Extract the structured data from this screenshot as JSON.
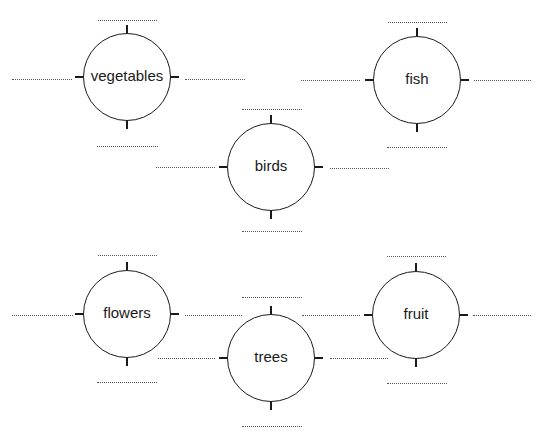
{
  "diagram": {
    "type": "word-web-worksheet",
    "stroke_color": "#1a1a1a",
    "blank_color": "#555555",
    "nodes": [
      {
        "id": "vegetables",
        "label": "vegetables",
        "cx": 127,
        "cy": 77,
        "r": 44,
        "blanks": {
          "top": {
            "x1": 98,
            "x2": 157,
            "y": 20
          },
          "left": {
            "x1": 12,
            "x2": 72,
            "y": 79
          },
          "right": {
            "x1": 185,
            "x2": 245,
            "y": 79
          },
          "bottom": {
            "x1": 97,
            "x2": 158,
            "y": 146
          }
        }
      },
      {
        "id": "fish",
        "label": "fish",
        "cx": 417,
        "cy": 80,
        "r": 44,
        "blanks": {
          "top": {
            "x1": 388,
            "x2": 447,
            "y": 22
          },
          "left": {
            "x1": 301,
            "x2": 360,
            "y": 80
          },
          "right": {
            "x1": 474,
            "x2": 531,
            "y": 80
          },
          "bottom": {
            "x1": 387,
            "x2": 447,
            "y": 147
          }
        }
      },
      {
        "id": "birds",
        "label": "birds",
        "cx": 271,
        "cy": 167,
        "r": 44,
        "blanks": {
          "top": {
            "x1": 242,
            "x2": 302,
            "y": 109
          },
          "left": {
            "x1": 156,
            "x2": 215,
            "y": 167
          },
          "right": {
            "x1": 330,
            "x2": 389,
            "y": 168
          },
          "bottom": {
            "x1": 242,
            "x2": 302,
            "y": 231
          }
        }
      },
      {
        "id": "flowers",
        "label": "flowers",
        "cx": 127,
        "cy": 314,
        "r": 44,
        "blanks": {
          "top": {
            "x1": 98,
            "x2": 157,
            "y": 255
          },
          "left": {
            "x1": 12,
            "x2": 73,
            "y": 315
          },
          "right": {
            "x1": 185,
            "x2": 242,
            "y": 315
          },
          "bottom": {
            "x1": 97,
            "x2": 157,
            "y": 382
          }
        }
      },
      {
        "id": "trees",
        "label": "trees",
        "cx": 271,
        "cy": 358,
        "r": 44,
        "blanks": {
          "top": {
            "x1": 242,
            "x2": 302,
            "y": 297
          },
          "left": {
            "x1": 158,
            "x2": 215,
            "y": 358
          },
          "right": {
            "x1": 330,
            "x2": 388,
            "y": 358
          },
          "bottom": {
            "x1": 242,
            "x2": 302,
            "y": 426
          }
        }
      },
      {
        "id": "fruit",
        "label": "fruit",
        "cx": 416,
        "cy": 315,
        "r": 44,
        "blanks": {
          "top": {
            "x1": 387,
            "x2": 446,
            "y": 256
          },
          "left": {
            "x1": 302,
            "x2": 360,
            "y": 315
          },
          "right": {
            "x1": 473,
            "x2": 531,
            "y": 315
          },
          "bottom": {
            "x1": 387,
            "x2": 447,
            "y": 383
          }
        }
      }
    ]
  }
}
